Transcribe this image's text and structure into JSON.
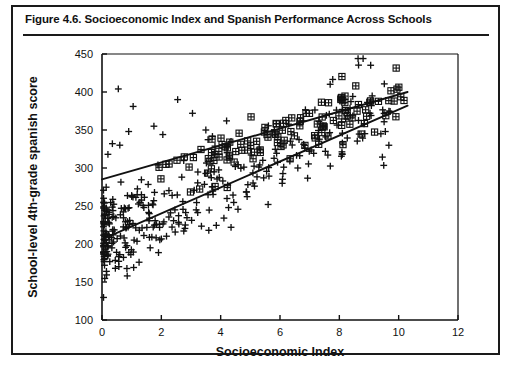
{
  "figure": {
    "title": "Figure 4.6.  Socioeconomic Index and Spanish Performance Across Schools"
  },
  "chart_data": {
    "type": "scatter",
    "title": "Socioeconomic Index and Spanish Performance Across Schools",
    "xlabel": "Socioeconomic Index",
    "ylabel": "School-level 4th-grade spanish score",
    "xlim": [
      0,
      12
    ],
    "ylim": [
      100,
      450
    ],
    "xticks": [
      0,
      2,
      4,
      6,
      8,
      10,
      12
    ],
    "yticks": [
      100,
      150,
      200,
      250,
      300,
      350,
      400,
      450
    ],
    "grid": false,
    "legend": "none",
    "series": [
      {
        "name": "public-schools",
        "marker": "plus",
        "n": 330,
        "x_range": [
          0.05,
          9.8
        ],
        "x_skew": 2.35,
        "intercept": 205,
        "slope": 19.0,
        "noise_sd": 28,
        "seed": 20394
      },
      {
        "name": "private-schools",
        "marker": "boxed-plus",
        "n": 120,
        "x_range": [
          1.6,
          10.2
        ],
        "x_skew": 0.85,
        "intercept": 268,
        "slope": 12.5,
        "noise_sd": 19,
        "seed": 77311
      }
    ],
    "trend_lines": [
      {
        "name": "upper-trend-line",
        "x0": 0.0,
        "y0": 285,
        "x1": 10.3,
        "y1": 400
      },
      {
        "name": "lower-trend-line",
        "x0": 0.0,
        "y0": 206,
        "x1": 10.3,
        "y1": 382
      }
    ],
    "outliers_high": [
      {
        "x": 0.55,
        "y": 404
      },
      {
        "x": 1.05,
        "y": 381
      },
      {
        "x": 2.55,
        "y": 390
      },
      {
        "x": 3.05,
        "y": 372
      },
      {
        "x": 1.75,
        "y": 355
      },
      {
        "x": 0.9,
        "y": 348
      },
      {
        "x": 0.35,
        "y": 332
      },
      {
        "x": 0.6,
        "y": 330
      },
      {
        "x": 2.05,
        "y": 344
      },
      {
        "x": 3.5,
        "y": 350
      },
      {
        "x": 4.2,
        "y": 362
      },
      {
        "x": 0.2,
        "y": 318
      }
    ],
    "outliers_low": [
      {
        "x": 0.15,
        "y": 164
      },
      {
        "x": 0.45,
        "y": 168
      },
      {
        "x": 0.85,
        "y": 158
      },
      {
        "x": 0.6,
        "y": 186
      },
      {
        "x": 1.25,
        "y": 176
      },
      {
        "x": 5.6,
        "y": 252
      },
      {
        "x": 5.45,
        "y": 287
      },
      {
        "x": 6.6,
        "y": 300
      },
      {
        "x": 3.6,
        "y": 218
      },
      {
        "x": 4.35,
        "y": 222
      },
      {
        "x": 8.1,
        "y": 318
      },
      {
        "x": 9.4,
        "y": 345
      },
      {
        "x": 9.55,
        "y": 348
      }
    ]
  },
  "colors": {
    "ink": "#111111",
    "frame": "#1a1a1a",
    "background": "#ffffff"
  }
}
